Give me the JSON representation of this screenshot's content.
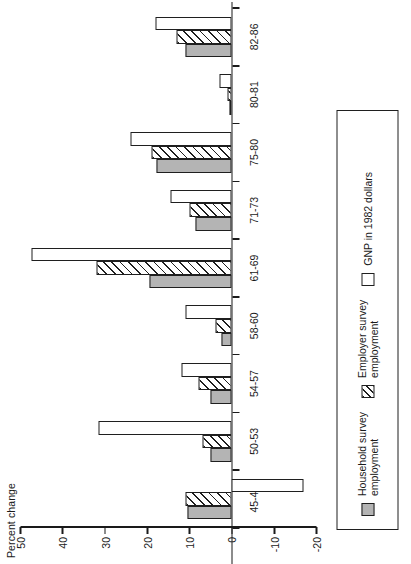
{
  "chart_data": {
    "type": "bar",
    "orientation": "horizontal-rotated",
    "title": "",
    "xlabel": "",
    "ylabel": "Percent change",
    "axis_title": "Percent change",
    "categories": [
      "45-48",
      "50-53",
      "54-57",
      "58-60",
      "61-69",
      "71-73",
      "75-80",
      "80-81",
      "82-86"
    ],
    "tick_labels": [
      "50",
      "40",
      "30",
      "20",
      "10",
      "0",
      "-10",
      "-20"
    ],
    "tick_values": [
      50,
      40,
      30,
      20,
      10,
      0,
      -10,
      -20
    ],
    "ylim": [
      -20,
      50
    ],
    "grid": false,
    "legend_position": "bottom-right",
    "series": [
      {
        "name": "Household survey employment",
        "legend_label": "Household survey\nemployment",
        "pattern": "solid-gray",
        "color": "#b4b4b4",
        "values": [
          10.5,
          5.0,
          5.0,
          2.5,
          19.5,
          8.5,
          17.8,
          0.5,
          11.0
        ]
      },
      {
        "name": "Employer survey employment",
        "legend_label": "Employer survey\nemployment",
        "pattern": "diagonal-hatch",
        "color": "#ffffff",
        "values": [
          11.0,
          7.0,
          8.0,
          4.0,
          32.0,
          10.0,
          19.0,
          1.0,
          13.0
        ]
      },
      {
        "name": "GNP in 1982 dollars",
        "legend_label": "GNP in 1982 dollars",
        "pattern": "open",
        "color": "#ffffff",
        "values": [
          -17.0,
          31.5,
          12.0,
          11.0,
          47.5,
          14.5,
          24.0,
          3.0,
          18.0
        ]
      }
    ]
  },
  "legend": {
    "entries": [
      {
        "label": "Household survey\nemployment",
        "swatch": "household"
      },
      {
        "label": "Employer survey\nemployment",
        "swatch": "employer"
      },
      {
        "label": "GNP in 1982 dollars",
        "swatch": "gnp"
      }
    ]
  }
}
